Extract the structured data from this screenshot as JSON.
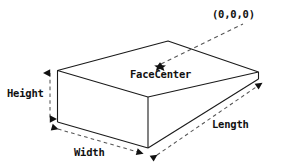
{
  "diagram": {
    "shape": "rectangular-box-3d",
    "stroke_color": "#1a1a1a",
    "background_color": "#ffffff",
    "labels": {
      "origin": "(0,0,0)",
      "face_center": "FaceCenter",
      "height": "Height",
      "width": "Width",
      "length": "Length"
    },
    "markers": {
      "face_center_point": "dot-marker"
    },
    "dimension_lines": [
      {
        "name": "height",
        "style": "dashed",
        "arrows": "both",
        "orientation": "vertical"
      },
      {
        "name": "width",
        "style": "dashed",
        "arrows": "both",
        "orientation": "diagonal-front-left"
      },
      {
        "name": "length",
        "style": "dashed",
        "arrows": "both",
        "orientation": "diagonal-front-right"
      },
      {
        "name": "origin-leader",
        "style": "dashed",
        "arrows": "none",
        "orientation": "diagonal-up-right"
      }
    ]
  }
}
